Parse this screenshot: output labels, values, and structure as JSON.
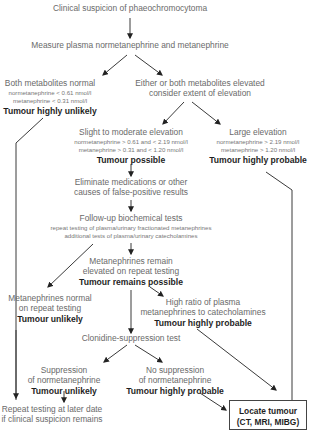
{
  "diagram": {
    "start": {
      "label": "Clinical suspicion of phaeochromocytoma"
    },
    "measure": {
      "label": "Measure plasma normetanephrine and metanephrine"
    },
    "normal": {
      "label": "Both metabolites normal",
      "detail1": "normetanephrine < 0.61 nmol/l",
      "detail2": "metanephrine < 0.31 nmol/l",
      "verdict": "Tumour highly unlikely"
    },
    "elevated": {
      "line1": "Either or both metabolites elevated",
      "line2": "consider extent of elevation"
    },
    "slight": {
      "label": "Slight to moderate elevation",
      "detail1": "normetanephrine > 0.61  and < 2.19 nmol/l",
      "detail2": "metanephrine > 0.31 and < 1.20 nmol/l",
      "verdict": "Tumour possible"
    },
    "large": {
      "label": "Large elevation",
      "detail1": "normetanephrine > 2.19 nmol/l",
      "detail2": "metanephrine > 1.20 nmol/l",
      "verdict": "Tumour highly probable"
    },
    "eliminate": {
      "line1": "Eliminate medications or other",
      "line2": "causes of false-positive results"
    },
    "followup": {
      "label": "Follow-up biochemical tests",
      "detail1": "repeat testing of plasma/urinary fractionated metanephrines",
      "detail2": "additional tests of plasma/urinary catecholamines"
    },
    "remain": {
      "line1": "Metanephrines remain",
      "line2": "elevated on repeat testing",
      "verdict": "Tumour remains possible"
    },
    "normal_repeat": {
      "line1": "Metanephrines normal",
      "line2": "on repeat testing",
      "verdict": "Tumour unlikely"
    },
    "high_ratio": {
      "line1": "High ratio of plasma",
      "line2": "metanephrines to catecholamines",
      "verdict": "Tumour highly probable"
    },
    "clonidine": {
      "label": "Clonidine-suppression test"
    },
    "suppression": {
      "line1": "Suppression",
      "line2": "of normetanephrine",
      "verdict": "Tumour unlikely"
    },
    "no_suppression": {
      "line1": "No suppression",
      "line2": "of normetanephrine",
      "verdict": "Tumour highly probable"
    },
    "repeat_later": {
      "line1": "Repeat testing at later date",
      "line2": "if clinical suspicion remains"
    },
    "locate": {
      "line1": "Locate tumour",
      "line2": "(CT, MRI, MIBG)"
    },
    "colors": {
      "line": "#3a3a3a",
      "text": "#6a6a6a",
      "bold": "#1f1f1f"
    }
  }
}
